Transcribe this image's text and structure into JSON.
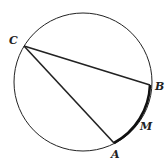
{
  "diagram": {
    "type": "circle-with-inscribed-chords",
    "circle": {
      "cx": 83,
      "cy": 82,
      "r": 69
    },
    "points": {
      "C": {
        "x": 24,
        "y": 46,
        "label": "C",
        "lx": 9,
        "ly": 44
      },
      "B": {
        "x": 150,
        "y": 85,
        "label": "B",
        "lx": 155,
        "ly": 90
      },
      "A": {
        "x": 114,
        "y": 143,
        "label": "A",
        "lx": 111,
        "ly": 158
      },
      "M": {
        "label": "M",
        "lx": 140,
        "ly": 130
      }
    },
    "chords": [
      "CB",
      "CA"
    ],
    "highlighted_arc": "AMB",
    "colors": {
      "stroke": "#222222",
      "background": "#ffffff"
    }
  }
}
